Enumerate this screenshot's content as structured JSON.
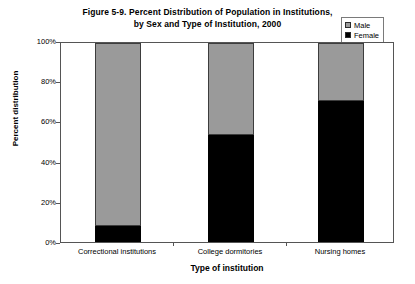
{
  "title": {
    "line1": "Figure 5-9. Percent Distribution of Population in Institutions,",
    "line2": "by Sex and Type of Institution, 2000"
  },
  "legend": {
    "male_label": "Male",
    "female_label": "Female"
  },
  "colors": {
    "male": "#9a9a9a",
    "female": "#000000",
    "axis": "#555555"
  },
  "chart_data": {
    "type": "bar",
    "stacked": true,
    "stack_mode": "percent",
    "title": "Figure 5-9. Percent Distribution of Population in Institutions, by Sex and Type of Institution, 2000",
    "xlabel": "Type of institution",
    "ylabel": "Percent distribution",
    "categories": [
      "Correctional institutions",
      "College dormitories",
      "Nursing homes"
    ],
    "ylim": [
      0,
      100
    ],
    "yticks": [
      0,
      20,
      40,
      60,
      80,
      100
    ],
    "ytick_labels": [
      "0%",
      "20%",
      "40%",
      "60%",
      "80%",
      "100%"
    ],
    "grid": false,
    "legend_position": "top-right",
    "series": [
      {
        "name": "Female",
        "color": "#000000",
        "values": [
          8,
          54,
          71
        ]
      },
      {
        "name": "Male",
        "color": "#9a9a9a",
        "values": [
          92,
          46,
          29
        ]
      }
    ]
  }
}
